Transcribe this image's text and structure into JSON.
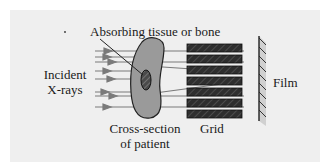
{
  "figure": {
    "labels": {
      "absorber": "Absorbing tissue or bone",
      "incident_line1": "Incident",
      "incident_line2": "X-rays",
      "patient_line1": "Cross-section",
      "patient_line2": "of patient",
      "grid": "Grid",
      "film": "Film"
    },
    "colors": {
      "background_panel": "#efefef",
      "patient_fill": "#9a9a9a",
      "absorber_fill": "#4a4a4a",
      "grid_fill": "#2e2e2e",
      "ray": "#7a7a7a",
      "film_fill": "#d0d0d0"
    },
    "elements": {
      "grid_slats": 7,
      "incident_rays": 9,
      "film_hatch_marks": 9
    }
  }
}
